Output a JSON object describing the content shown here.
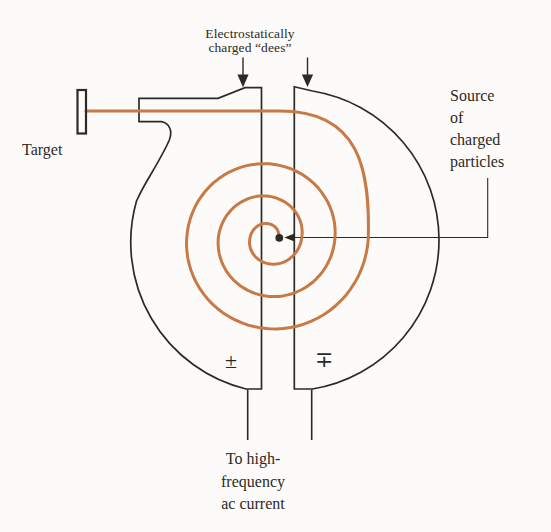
{
  "figure": {
    "dees_label": {
      "line1": "Electrostatically",
      "line2": "charged “dees”"
    },
    "target_label": "Target",
    "source_label": {
      "line1": "Source",
      "line2": "of",
      "line3": "charged",
      "line4": "particles"
    },
    "ac_label": {
      "line1": "To high-",
      "line2": "frequency",
      "line3": "ac current"
    },
    "polarity": {
      "left": "±",
      "right": "∓"
    }
  },
  "colors": {
    "background": "#fcfbf9",
    "outline": "#2d2a25",
    "text": "#2d2a25",
    "beam": "#c87a46"
  }
}
